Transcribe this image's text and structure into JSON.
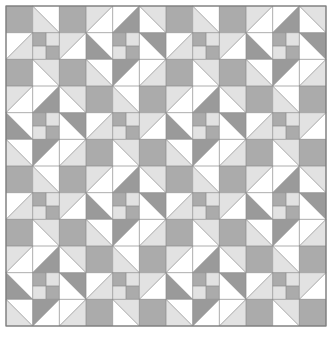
{
  "artwork": {
    "title": "Patchwork Quilt Pattern",
    "type": "geometric-tiling",
    "canvas": {
      "width": 334,
      "height": 343,
      "background": "#ffffff"
    },
    "grid": {
      "origin_x": 6,
      "origin_y": 6,
      "block_size": 80,
      "cell_size": 26.6667,
      "blocks_across": 4,
      "blocks_down": 4,
      "cells_across": 12,
      "cells_down": 12,
      "line_color": "#8a8a8a",
      "line_width": 0.7,
      "outer_border_color": "#7e7e7e",
      "outer_border_width": 1.2
    },
    "palette": {
      "white": "#ffffff",
      "light_gray": "#e2e2e2",
      "medium_gray": "#ababab",
      "dark_gray": "#9a9a9a",
      "line": "#8a8a8a",
      "border": "#7e7e7e"
    },
    "block_types": [
      {
        "id": "A",
        "name": "star-block-light",
        "description": "Corners solid medium gray, edge cells half-square triangles in light gray, center four-patch"
      },
      {
        "id": "B",
        "name": "pinwheel-block-dark",
        "description": "Pinwheel of dark gray triangles on white with light gray accents, center four-patch"
      }
    ],
    "block_layout": [
      [
        "A",
        "B",
        "A",
        "B"
      ],
      [
        "B",
        "A",
        "B",
        "A"
      ],
      [
        "A",
        "B",
        "A",
        "B"
      ],
      [
        "B",
        "A",
        "B",
        "A"
      ]
    ],
    "block_A": {
      "cells": [
        {
          "r": 0,
          "c": 0,
          "shape": "solid",
          "fill": "medium_gray"
        },
        {
          "r": 0,
          "c": 1,
          "shape": "tri-bl",
          "fill": "light_gray",
          "bg": "white"
        },
        {
          "r": 0,
          "c": 2,
          "shape": "solid",
          "fill": "medium_gray"
        },
        {
          "r": 1,
          "c": 0,
          "shape": "tri-br",
          "fill": "light_gray",
          "bg": "white"
        },
        {
          "r": 1,
          "c": 1,
          "shape": "fourpatch",
          "tl": "medium_gray",
          "tr": "light_gray",
          "bl": "light_gray",
          "br": "medium_gray"
        },
        {
          "r": 1,
          "c": 2,
          "shape": "tri-tl",
          "fill": "light_gray",
          "bg": "white"
        },
        {
          "r": 2,
          "c": 0,
          "shape": "solid",
          "fill": "medium_gray"
        },
        {
          "r": 2,
          "c": 1,
          "shape": "tri-tr",
          "fill": "light_gray",
          "bg": "white"
        },
        {
          "r": 2,
          "c": 2,
          "shape": "solid",
          "fill": "medium_gray"
        }
      ]
    },
    "block_B": {
      "cells": [
        {
          "r": 0,
          "c": 0,
          "shape": "tri-tl",
          "fill": "light_gray",
          "bg": "white"
        },
        {
          "r": 0,
          "c": 1,
          "shape": "tri-br",
          "fill": "dark_gray",
          "bg": "white"
        },
        {
          "r": 0,
          "c": 2,
          "shape": "tri-tr",
          "fill": "light_gray",
          "bg": "white"
        },
        {
          "r": 1,
          "c": 0,
          "shape": "tri-bl",
          "fill": "dark_gray",
          "bg": "white"
        },
        {
          "r": 1,
          "c": 1,
          "shape": "fourpatch",
          "tl": "medium_gray",
          "tr": "light_gray",
          "bl": "light_gray",
          "br": "medium_gray"
        },
        {
          "r": 1,
          "c": 2,
          "shape": "tri-tr",
          "fill": "dark_gray",
          "bg": "white"
        },
        {
          "r": 2,
          "c": 0,
          "shape": "tri-bl",
          "fill": "light_gray",
          "bg": "white"
        },
        {
          "r": 2,
          "c": 1,
          "shape": "tri-tl",
          "fill": "dark_gray",
          "bg": "white"
        },
        {
          "r": 2,
          "c": 2,
          "shape": "tri-br",
          "fill": "light_gray",
          "bg": "white"
        }
      ]
    }
  }
}
